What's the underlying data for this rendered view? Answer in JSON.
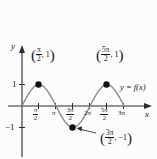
{
  "chart_data": {
    "type": "line",
    "title": "",
    "xlabel": "x",
    "ylabel": "y",
    "function_label": "y = f(x)",
    "xlim": [
      0,
      9.8
    ],
    "ylim": [
      -1.45,
      1.45
    ],
    "grid": false,
    "legend_position": "inline-right",
    "x_tick_labels": [
      "π/2",
      "π",
      "3π/2",
      "2π",
      "5π/2",
      "3π"
    ],
    "x_tick_values": [
      1.5708,
      3.1416,
      4.7124,
      6.2832,
      7.854,
      9.4248
    ],
    "y_tick_labels": [
      "1",
      "-1"
    ],
    "y_tick_values": [
      1,
      -1
    ],
    "series": [
      {
        "name": "f(x) = sin(x)",
        "x": [
          0,
          0.3927,
          0.7854,
          1.1781,
          1.5708,
          1.9635,
          2.3562,
          2.7489,
          3.1416,
          3.5343,
          3.927,
          4.3197,
          4.7124,
          5.1051,
          5.4978,
          5.8905,
          6.2832,
          6.6759,
          7.0686,
          7.4613,
          7.854,
          8.2467,
          8.6394,
          9.0321,
          9.4248
        ],
        "y": [
          0,
          0.3827,
          0.7071,
          0.9239,
          1,
          0.9239,
          0.7071,
          0.3827,
          0,
          -0.3827,
          -0.7071,
          -0.9239,
          -1,
          -0.9239,
          -0.7071,
          -0.3827,
          0,
          0.3827,
          0.7071,
          0.9239,
          1,
          0.9239,
          0.7071,
          0.3827,
          0
        ]
      }
    ],
    "marked_points": [
      {
        "label": "(π/2, 1)",
        "x": 1.5708,
        "y": 1,
        "num": "π",
        "den": "2",
        "value": "1"
      },
      {
        "label": "(5π/2, 1)",
        "x": 7.854,
        "y": 1,
        "num": "5π",
        "den": "2",
        "value": "1"
      },
      {
        "label": "(3π/2, -1)",
        "x": 4.7124,
        "y": -1,
        "num": "3π",
        "den": "2",
        "value": "−1"
      }
    ]
  },
  "axes": {
    "y_label": "y",
    "x_label": "x",
    "y_tick_1": "1",
    "y_tick_neg1": "−1"
  },
  "ticks": {
    "t1_num": "π",
    "t1_den": "2",
    "t2": "π",
    "t3_num": "3π",
    "t3_den": "2",
    "t4": "2π",
    "t5_num": "5π",
    "t5_den": "2",
    "t6": "3π"
  },
  "annotations": {
    "max1_num": "π",
    "max1_den": "2",
    "max1_val": "1",
    "max2_num": "5π",
    "max2_den": "2",
    "max2_val": "1",
    "min_num": "3π",
    "min_den": "2",
    "min_val": "−1",
    "curve_label": "y = f(x)",
    "comma": ", ",
    "open_paren": "(",
    "close_paren": ")"
  },
  "colors": {
    "curve": "#8a8a8a",
    "axis": "#2b2b2b",
    "point": "#111111",
    "text": "#1a1a1a",
    "background": "#fcfcfc"
  }
}
